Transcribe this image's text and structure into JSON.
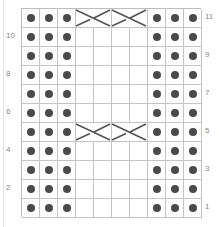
{
  "title": "",
  "grid": {
    "columns": 10,
    "rows": 11
  },
  "colors": {
    "dot": "#4a4a4a",
    "grid_line": "#c4c4c4",
    "cable_line": "#555555",
    "label": "#8a8a8a"
  },
  "legend_symbols": {
    "dot": "purl-stitch",
    "blank": "knit-stitch",
    "cable": "2-over-2 cable cross"
  },
  "row_labels": [
    {
      "row": 11,
      "text": "11",
      "side": "right"
    },
    {
      "row": 10,
      "text": "10",
      "side": "left"
    },
    {
      "row": 9,
      "text": "9",
      "side": "right"
    },
    {
      "row": 8,
      "text": "8",
      "side": "left"
    },
    {
      "row": 7,
      "text": "7",
      "side": "right"
    },
    {
      "row": 6,
      "text": "6",
      "side": "left"
    },
    {
      "row": 5,
      "text": "5",
      "side": "right"
    },
    {
      "row": 4,
      "text": "4",
      "side": "left"
    },
    {
      "row": 3,
      "text": "3",
      "side": "right"
    },
    {
      "row": 2,
      "text": "2",
      "side": "left"
    },
    {
      "row": 1,
      "text": "1",
      "side": "right"
    }
  ],
  "pattern_rows_top_to_bottom": [
    {
      "row": 11,
      "cells": [
        "P",
        "P",
        "P",
        "C",
        "C",
        "C",
        "C",
        "P",
        "P",
        "P"
      ]
    },
    {
      "row": 10,
      "cells": [
        "P",
        "P",
        "P",
        "K",
        "K",
        "K",
        "K",
        "P",
        "P",
        "P"
      ]
    },
    {
      "row": 9,
      "cells": [
        "P",
        "P",
        "P",
        "K",
        "K",
        "K",
        "K",
        "P",
        "P",
        "P"
      ]
    },
    {
      "row": 8,
      "cells": [
        "P",
        "P",
        "P",
        "K",
        "K",
        "K",
        "K",
        "P",
        "P",
        "P"
      ]
    },
    {
      "row": 7,
      "cells": [
        "P",
        "P",
        "P",
        "K",
        "K",
        "K",
        "K",
        "P",
        "P",
        "P"
      ]
    },
    {
      "row": 6,
      "cells": [
        "P",
        "P",
        "P",
        "K",
        "K",
        "K",
        "K",
        "P",
        "P",
        "P"
      ]
    },
    {
      "row": 5,
      "cells": [
        "P",
        "P",
        "P",
        "C",
        "C",
        "C",
        "C",
        "P",
        "P",
        "P"
      ]
    },
    {
      "row": 4,
      "cells": [
        "P",
        "P",
        "P",
        "K",
        "K",
        "K",
        "K",
        "P",
        "P",
        "P"
      ]
    },
    {
      "row": 3,
      "cells": [
        "P",
        "P",
        "P",
        "K",
        "K",
        "K",
        "K",
        "P",
        "P",
        "P"
      ]
    },
    {
      "row": 2,
      "cells": [
        "P",
        "P",
        "P",
        "K",
        "K",
        "K",
        "K",
        "P",
        "P",
        "P"
      ]
    },
    {
      "row": 1,
      "cells": [
        "P",
        "P",
        "P",
        "K",
        "K",
        "K",
        "K",
        "P",
        "P",
        "P"
      ]
    }
  ],
  "cables": [
    {
      "row": 11,
      "start_col": 4,
      "span": 2
    },
    {
      "row": 11,
      "start_col": 6,
      "span": 2
    },
    {
      "row": 5,
      "start_col": 4,
      "span": 2
    },
    {
      "row": 5,
      "start_col": 6,
      "span": 2
    }
  ]
}
